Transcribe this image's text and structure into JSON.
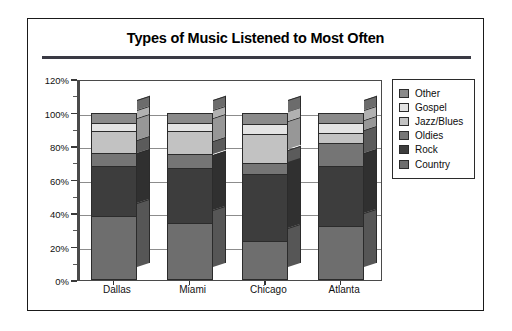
{
  "chart_data": {
    "type": "bar",
    "subtype": "stacked-bar-100-percent-3d",
    "title": "Types of Music Listened to Most Often",
    "xlabel": "",
    "ylabel": "",
    "categories": [
      "Dallas",
      "Miami",
      "Chicago",
      "Atlanta"
    ],
    "series": [
      {
        "name": "Country",
        "color": "#6e6e6e",
        "values": [
          38,
          34,
          23,
          32
        ]
      },
      {
        "name": "Rock",
        "color": "#3d3d3d",
        "values": [
          30,
          33,
          40,
          36
        ]
      },
      {
        "name": "Oldies",
        "color": "#757575",
        "values": [
          8,
          8,
          7,
          14
        ]
      },
      {
        "name": "Jazz/Blues",
        "color": "#c2c2c2",
        "values": [
          13,
          14,
          17,
          6
        ]
      },
      {
        "name": "Gospel",
        "color": "#e3e3e3",
        "values": [
          5,
          5,
          6,
          6
        ]
      },
      {
        "name": "Other",
        "color": "#8a8a8a",
        "values": [
          6,
          6,
          7,
          6
        ]
      }
    ],
    "ylim": [
      0,
      120
    ],
    "yticks": [
      0,
      20,
      40,
      60,
      80,
      100,
      120
    ],
    "ytick_labels": [
      "0%",
      "20%",
      "40%",
      "60%",
      "80%",
      "100%",
      "120%"
    ],
    "minor_yticks": [
      10,
      30,
      50,
      70,
      90,
      110
    ],
    "grid": true,
    "grid_axis": "y",
    "legend_position": "right",
    "legend_order": [
      "Other",
      "Gospel",
      "Jazz/Blues",
      "Oldies",
      "Rock",
      "Country"
    ],
    "stack_total": 100
  },
  "legend": {
    "items": [
      {
        "label": "Other",
        "color": "#8a8a8a"
      },
      {
        "label": "Gospel",
        "color": "#e3e3e3"
      },
      {
        "label": "Jazz/Blues",
        "color": "#c2c2c2"
      },
      {
        "label": "Oldies",
        "color": "#757575"
      },
      {
        "label": "Rock",
        "color": "#3d3d3d"
      },
      {
        "label": "Country",
        "color": "#6e6e6e"
      }
    ]
  },
  "colors": {
    "frame": "#1a1a1a",
    "title_rule": "#3a3a44",
    "gridline": "#8c8c8c",
    "axis": "#4a4a4a",
    "background": "#ffffff",
    "segment_outline": "#2b2b2b"
  }
}
